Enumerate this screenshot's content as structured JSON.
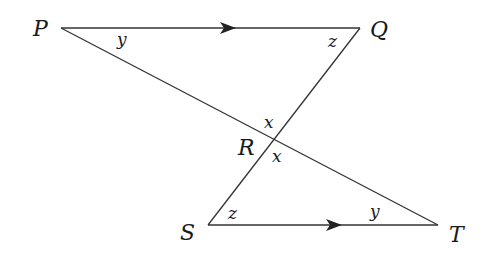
{
  "diagram": {
    "points": {
      "P": {
        "label": "P",
        "x": 61,
        "y": 28
      },
      "Q": {
        "label": "Q",
        "x": 360,
        "y": 28
      },
      "R": {
        "label": "R",
        "x": 275,
        "y": 139
      },
      "S": {
        "label": "S",
        "x": 208,
        "y": 225
      },
      "T": {
        "label": "T",
        "x": 438,
        "y": 225
      }
    },
    "segments": [
      "PQ",
      "PT",
      "QS",
      "ST"
    ],
    "parallel_marks": [
      "PQ",
      "ST"
    ],
    "angles": {
      "at_P": "y",
      "at_Q": "z",
      "at_R_top": "x",
      "at_R_bottom": "x",
      "at_S": "z",
      "at_T": "y"
    },
    "colors": {
      "line": "#333333",
      "text": "#1a1a1a",
      "background": "#ffffff"
    }
  }
}
